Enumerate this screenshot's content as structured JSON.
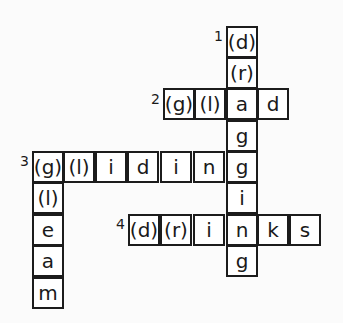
{
  "puzzle": {
    "cell_size": 31,
    "clue_numbers": [
      {
        "label": "1",
        "x": 214,
        "y": 28
      },
      {
        "label": "2",
        "x": 151,
        "y": 91
      },
      {
        "label": "3",
        "x": 20,
        "y": 153
      },
      {
        "label": "4",
        "x": 116,
        "y": 216
      }
    ],
    "words": [
      {
        "number": 1,
        "direction": "down",
        "answer": "dragging"
      },
      {
        "number": 2,
        "direction": "across",
        "answer": "gload"
      },
      {
        "number": 3,
        "direction": "across",
        "answer": "gliding"
      },
      {
        "number": 3,
        "direction": "down",
        "answer": "gleam"
      },
      {
        "number": 4,
        "direction": "across",
        "answer": "drinks"
      }
    ],
    "cells": [
      {
        "x": 226,
        "y": 26,
        "text": "(d)"
      },
      {
        "x": 226,
        "y": 57,
        "text": "(r)"
      },
      {
        "x": 163,
        "y": 88,
        "text": "(g)"
      },
      {
        "x": 194,
        "y": 88,
        "text": "(l)"
      },
      {
        "x": 226,
        "y": 88,
        "text": "a"
      },
      {
        "x": 257,
        "y": 88,
        "text": "d"
      },
      {
        "x": 226,
        "y": 120,
        "text": "g"
      },
      {
        "x": 32,
        "y": 151,
        "text": "(g)"
      },
      {
        "x": 63,
        "y": 151,
        "text": "(l)"
      },
      {
        "x": 95,
        "y": 151,
        "text": "i"
      },
      {
        "x": 127,
        "y": 151,
        "text": "d"
      },
      {
        "x": 160,
        "y": 151,
        "text": "i"
      },
      {
        "x": 193,
        "y": 151,
        "text": "n"
      },
      {
        "x": 226,
        "y": 151,
        "text": "g"
      },
      {
        "x": 32,
        "y": 182,
        "text": "(l)"
      },
      {
        "x": 226,
        "y": 182,
        "text": "i"
      },
      {
        "x": 32,
        "y": 214,
        "text": "e"
      },
      {
        "x": 128,
        "y": 214,
        "text": "(d)"
      },
      {
        "x": 160,
        "y": 214,
        "text": "(r)"
      },
      {
        "x": 193,
        "y": 214,
        "text": "i"
      },
      {
        "x": 226,
        "y": 214,
        "text": "n"
      },
      {
        "x": 257,
        "y": 214,
        "text": "k"
      },
      {
        "x": 289,
        "y": 214,
        "text": "s"
      },
      {
        "x": 32,
        "y": 245,
        "text": "a"
      },
      {
        "x": 226,
        "y": 245,
        "text": "g"
      },
      {
        "x": 32,
        "y": 277,
        "text": "m"
      }
    ]
  }
}
